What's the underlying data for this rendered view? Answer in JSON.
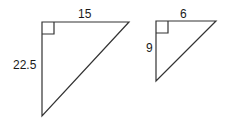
{
  "diagram": {
    "type": "similar right triangles",
    "triangles": [
      {
        "name": "large",
        "top_label": "15",
        "left_label": "22.5",
        "right_angle_marker": true
      },
      {
        "name": "small",
        "top_label": "6",
        "left_label": "9",
        "right_angle_marker": true
      }
    ],
    "stroke_color": "#333333"
  }
}
